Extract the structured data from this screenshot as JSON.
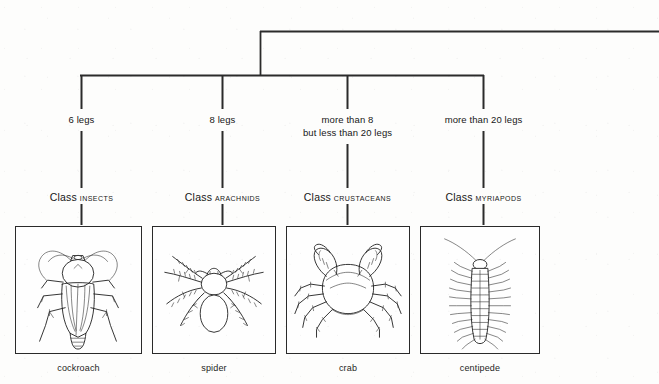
{
  "diagram": {
    "line_color": "#1c1c1c",
    "background_color": "#fdfdfc",
    "root_connector_note": "top horizontal line running off the right edge of the page"
  },
  "branches": [
    {
      "id": "insects",
      "criterion_lines": [
        "6 legs"
      ],
      "class_word": "Class",
      "taxon": "INSECTS",
      "caption": "cockroach",
      "illustration": "cockroach-drawing"
    },
    {
      "id": "arachnids",
      "criterion_lines": [
        "8 legs"
      ],
      "class_word": "Class",
      "taxon": "ARACHNIDS",
      "caption": "spider",
      "illustration": "spider-drawing"
    },
    {
      "id": "crustaceans",
      "criterion_lines": [
        "more than 8",
        "but less than 20 legs"
      ],
      "class_word": "Class",
      "taxon": "CRUSTACEANS",
      "caption": "crab",
      "illustration": "crab-drawing"
    },
    {
      "id": "myriapods",
      "criterion_lines": [
        "more than 20 legs"
      ],
      "class_word": "Class",
      "taxon": "MYRIAPODS",
      "caption": "centipede",
      "illustration": "centipede-drawing"
    }
  ]
}
